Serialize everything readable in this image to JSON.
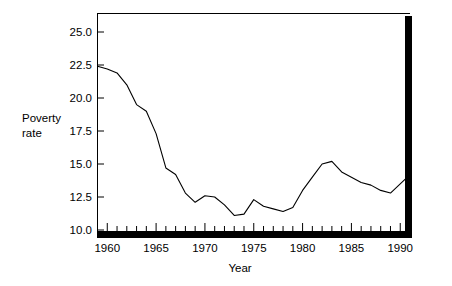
{
  "chart_data": {
    "type": "line",
    "title": "",
    "xlabel": "Year",
    "ylabel": "Poverty rate",
    "ylabel_line1": "Poverty",
    "ylabel_line2": "rate",
    "xlim": [
      1959,
      1991
    ],
    "ylim": [
      10.0,
      26.2
    ],
    "grid": false,
    "legend": false,
    "line_color": "#000000",
    "axis_color": "#000000",
    "background": "#ffffff",
    "x_tick_labels": [
      "1960",
      "1965",
      "1970",
      "1975",
      "1980",
      "1985",
      "1990"
    ],
    "x_tick_values": [
      1960,
      1965,
      1970,
      1975,
      1980,
      1985,
      1990
    ],
    "x_minor_tick_interval": 1,
    "y_tick_labels": [
      "10.0",
      "12.5",
      "15.0",
      "17.5",
      "20.0",
      "22.5",
      "25.0"
    ],
    "y_tick_values": [
      10.0,
      12.5,
      15.0,
      17.5,
      20.0,
      22.5,
      25.0
    ],
    "series": [
      {
        "name": "Poverty rate",
        "x": [
          1959,
          1960,
          1961,
          1962,
          1963,
          1964,
          1965,
          1966,
          1967,
          1968,
          1969,
          1970,
          1971,
          1972,
          1973,
          1974,
          1975,
          1976,
          1977,
          1978,
          1979,
          1980,
          1981,
          1982,
          1983,
          1984,
          1985,
          1986,
          1987,
          1988,
          1989,
          1990,
          1991
        ],
        "values": [
          22.4,
          22.2,
          21.9,
          21.0,
          19.5,
          19.0,
          17.3,
          14.7,
          14.2,
          12.8,
          12.1,
          12.6,
          12.5,
          11.9,
          11.1,
          11.2,
          12.3,
          11.8,
          11.6,
          11.4,
          11.7,
          13.0,
          14.0,
          15.0,
          15.2,
          14.4,
          14.0,
          13.6,
          13.4,
          13.0,
          12.8,
          13.5,
          14.2
        ]
      }
    ]
  }
}
